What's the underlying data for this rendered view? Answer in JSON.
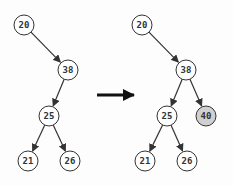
{
  "diagram": {
    "before": {
      "nodes": [
        {
          "id": "n20",
          "label": "20",
          "x": 24,
          "y": 25,
          "highlight": false
        },
        {
          "id": "n38",
          "label": "38",
          "x": 68,
          "y": 70,
          "highlight": false
        },
        {
          "id": "n25",
          "label": "25",
          "x": 49,
          "y": 116,
          "highlight": false
        },
        {
          "id": "n21",
          "label": "21",
          "x": 28,
          "y": 161,
          "highlight": false
        },
        {
          "id": "n26",
          "label": "26",
          "x": 70,
          "y": 161,
          "highlight": false
        }
      ],
      "edges": [
        [
          "n20",
          "n38"
        ],
        [
          "n38",
          "n25"
        ],
        [
          "n25",
          "n21"
        ],
        [
          "n25",
          "n26"
        ]
      ]
    },
    "after": {
      "nodes": [
        {
          "id": "m20",
          "label": "20",
          "x": 142,
          "y": 25,
          "highlight": false
        },
        {
          "id": "m38",
          "label": "38",
          "x": 186,
          "y": 70,
          "highlight": false
        },
        {
          "id": "m25",
          "label": "25",
          "x": 167,
          "y": 116,
          "highlight": false
        },
        {
          "id": "m40",
          "label": "40",
          "x": 206,
          "y": 116,
          "highlight": true
        },
        {
          "id": "m21",
          "label": "21",
          "x": 145,
          "y": 161,
          "highlight": false
        },
        {
          "id": "m26",
          "label": "26",
          "x": 187,
          "y": 161,
          "highlight": false
        }
      ],
      "edges": [
        [
          "m20",
          "m38"
        ],
        [
          "m38",
          "m25"
        ],
        [
          "m38",
          "m40"
        ],
        [
          "m25",
          "m21"
        ],
        [
          "m25",
          "m26"
        ]
      ]
    },
    "transition_arrow": {
      "x1": 97,
      "y1": 95,
      "x2": 134,
      "y2": 95
    },
    "colors": {
      "stroke": "#333333",
      "fill": "#ffffff",
      "highlight_fill": "#d0d0d0"
    }
  }
}
